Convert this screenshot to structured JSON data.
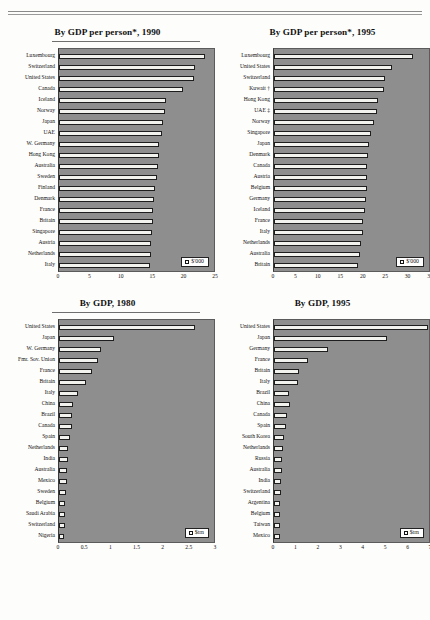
{
  "page": {
    "background_color": "#fdfdfb",
    "rule_color": "#8a8a8a",
    "plot_background_color": "#8e8e8e",
    "bar_fill_color": "#f2f2ee",
    "bar_border_color": "#1e1e1e"
  },
  "charts": [
    {
      "id": "gdp-per-person-1990",
      "title": "By GDP per person*, 1990",
      "legend_label": "$'000",
      "legend_marker": "white-square-swatch",
      "chart_data": {
        "type": "bar",
        "orientation": "horizontal",
        "title": "By GDP per person*, 1990",
        "xlabel": "",
        "ylabel": "",
        "xlim": [
          0,
          25
        ],
        "xticks": [
          0,
          5,
          10,
          15,
          20,
          25
        ],
        "unit": "$'000",
        "grid": false,
        "legend": "$'000",
        "legend_position": "bottom-right",
        "categories": [
          "Luxembourg",
          "Switzerland",
          "United States",
          "Canada",
          "Iceland",
          "Norway",
          "Japan",
          "UAE",
          "W. Germany",
          "Hong Kong",
          "Australia",
          "Sweden",
          "Finland",
          "Denmark",
          "France",
          "Britain",
          "Singapore",
          "Austria",
          "Netherlands",
          "Italy"
        ],
        "values": [
          23.6,
          22.0,
          21.8,
          20.0,
          17.2,
          17.1,
          16.8,
          16.6,
          16.2,
          16.1,
          15.9,
          15.8,
          15.5,
          15.4,
          15.2,
          15.1,
          15.0,
          14.9,
          14.8,
          14.7
        ]
      }
    },
    {
      "id": "gdp-per-person-1995",
      "title": "By GDP per person*, 1995",
      "legend_label": "$'000",
      "legend_marker": "white-square-swatch",
      "chart_data": {
        "type": "bar",
        "orientation": "horizontal",
        "title": "By GDP per person*, 1995",
        "xlabel": "",
        "ylabel": "",
        "xlim": [
          0,
          35
        ],
        "xticks": [
          0,
          5,
          10,
          15,
          20,
          25,
          30,
          35
        ],
        "unit": "$'000",
        "grid": false,
        "legend": "$'000",
        "legend_position": "bottom-right",
        "categories": [
          "Luxembourg",
          "United States",
          "Switzerland",
          "Kuwait †",
          "Hong Kong",
          "UAE ‡",
          "Norway",
          "Singapore",
          "Japan",
          "Denmark",
          "Canada",
          "Austria",
          "Belgium",
          "Germany",
          "Iceland",
          "France",
          "Italy",
          "Netherlands",
          "Australia",
          "Britain"
        ],
        "values": [
          31.3,
          26.7,
          25.0,
          24.8,
          23.5,
          23.3,
          22.6,
          21.8,
          21.4,
          21.2,
          21.1,
          21.0,
          20.9,
          20.7,
          20.5,
          20.2,
          20.0,
          19.7,
          19.4,
          19.0
        ]
      }
    },
    {
      "id": "gdp-1980",
      "title": "By GDP, 1980",
      "legend_label": "$trn",
      "legend_marker": "white-square-swatch",
      "chart_data": {
        "type": "bar",
        "orientation": "horizontal",
        "title": "By GDP, 1980",
        "xlabel": "",
        "ylabel": "",
        "xlim": [
          0,
          3
        ],
        "xticks": [
          0,
          0.5,
          1,
          1.5,
          2,
          2.5,
          3
        ],
        "xtick_labels": [
          "0",
          "0.5",
          "1",
          "1.5",
          "2",
          "2.5",
          "3"
        ],
        "unit": "$trn",
        "grid": false,
        "legend": "$trn",
        "legend_position": "bottom-right",
        "categories": [
          "United States",
          "Japan",
          "W. Germany",
          "Fmr. Sov. Union",
          "France",
          "Britain",
          "Italy",
          "China",
          "Brazil",
          "Canada",
          "Spain",
          "Netherlands",
          "India",
          "Australia",
          "Mexico",
          "Sweden",
          "Belgium",
          "Saudi Arabia",
          "Switzerland",
          "Nigeria"
        ],
        "values": [
          2.63,
          1.06,
          0.81,
          0.76,
          0.63,
          0.52,
          0.37,
          0.28,
          0.25,
          0.25,
          0.21,
          0.17,
          0.17,
          0.16,
          0.16,
          0.13,
          0.12,
          0.12,
          0.11,
          0.09
        ]
      }
    },
    {
      "id": "gdp-1995",
      "title": "By GDP, 1995",
      "legend_label": "$trn",
      "legend_marker": "white-square-swatch",
      "chart_data": {
        "type": "bar",
        "orientation": "horizontal",
        "title": "By GDP, 1995",
        "xlabel": "",
        "ylabel": "",
        "xlim": [
          0,
          7
        ],
        "xticks": [
          0,
          1,
          2,
          3,
          4,
          5,
          6,
          7
        ],
        "unit": "$trn",
        "grid": false,
        "legend": "$trn",
        "legend_position": "bottom-right",
        "categories": [
          "United States",
          "Japan",
          "Germany",
          "France",
          "Britain",
          "Italy",
          "Brazil",
          "China",
          "Canada",
          "Spain",
          "South Korea",
          "Netherlands",
          "Russia",
          "Australia",
          "India",
          "Switzerland",
          "Argentina",
          "Belgium",
          "Taiwan",
          "Mexico"
        ],
        "values": [
          6.95,
          5.11,
          2.42,
          1.54,
          1.11,
          1.09,
          0.69,
          0.7,
          0.57,
          0.56,
          0.46,
          0.4,
          0.37,
          0.35,
          0.33,
          0.31,
          0.28,
          0.27,
          0.26,
          0.25
        ]
      }
    }
  ]
}
